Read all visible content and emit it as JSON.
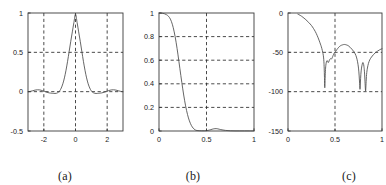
{
  "figure": {
    "background": "#ffffff",
    "axis_color": "#3a3a3a",
    "grid_color": "#2b2b2b",
    "curve_color": "#4a4a4a",
    "panel_count": 3
  },
  "panels": [
    {
      "id": "a",
      "caption": "(a)"
    },
    {
      "id": "b",
      "caption": "(b)"
    },
    {
      "id": "c",
      "caption": "(c)"
    }
  ],
  "chart_data": [
    {
      "type": "line",
      "panel": "a",
      "title": "",
      "xlabel": "",
      "ylabel": "",
      "xlim": [
        -3,
        3
      ],
      "ylim": [
        -0.5,
        1
      ],
      "xticks": [
        -2,
        0,
        2
      ],
      "xtick_labels": [
        "-2",
        "0",
        "2"
      ],
      "yticks": [
        -0.5,
        0,
        0.5,
        1
      ],
      "ytick_labels": [
        "-0.5",
        "0",
        "0.5",
        "1"
      ],
      "grid": true,
      "grid_lines_x": [
        -2,
        0,
        2
      ],
      "grid_lines_y": [
        0,
        0.5
      ],
      "legend": "none",
      "series": [
        {
          "name": "impulse-response",
          "x": [
            -3.0,
            -2.85,
            -2.7,
            -2.55,
            -2.4,
            -2.25,
            -2.1,
            -1.95,
            -1.8,
            -1.65,
            -1.5,
            -1.4,
            -1.3,
            -1.2,
            -1.1,
            -1.0,
            -0.9,
            -0.8,
            -0.7,
            -0.6,
            -0.5,
            -0.4,
            -0.3,
            -0.2,
            -0.1,
            0.0,
            0.1,
            0.2,
            0.3,
            0.4,
            0.5,
            0.6,
            0.7,
            0.8,
            0.9,
            1.0,
            1.1,
            1.2,
            1.3,
            1.4,
            1.5,
            1.65,
            1.8,
            1.95,
            2.1,
            2.25,
            2.4,
            2.55,
            2.7,
            2.85,
            3.0
          ],
          "y": [
            0.0,
            0.004,
            0.012,
            0.02,
            0.024,
            0.022,
            0.014,
            0.003,
            -0.008,
            -0.016,
            -0.02,
            -0.022,
            -0.023,
            -0.02,
            -0.01,
            0.01,
            0.046,
            0.1,
            0.175,
            0.272,
            0.386,
            0.512,
            0.64,
            0.76,
            0.88,
            0.985,
            0.88,
            0.76,
            0.64,
            0.512,
            0.386,
            0.272,
            0.175,
            0.1,
            0.046,
            0.01,
            -0.01,
            -0.02,
            -0.023,
            -0.022,
            -0.02,
            -0.016,
            -0.008,
            0.003,
            0.014,
            0.022,
            0.024,
            0.02,
            0.012,
            0.004,
            0.0
          ]
        }
      ]
    },
    {
      "type": "line",
      "panel": "b",
      "title": "",
      "xlabel": "",
      "ylabel": "",
      "xlim": [
        0,
        1
      ],
      "ylim": [
        0,
        1
      ],
      "xticks": [
        0,
        0.5,
        1
      ],
      "xtick_labels": [
        "0",
        "0.5",
        "1"
      ],
      "yticks": [
        0,
        0.2,
        0.4,
        0.6,
        0.8,
        1
      ],
      "ytick_labels": [
        "0",
        "0.2",
        "0.4",
        "0.6",
        "0.8",
        "1"
      ],
      "grid": true,
      "grid_lines_x": [
        0.5
      ],
      "grid_lines_y": [
        0.2,
        0.4,
        0.6,
        0.8
      ],
      "legend": "none",
      "series": [
        {
          "name": "magnitude-response-linear",
          "x": [
            0.0,
            0.02,
            0.04,
            0.06,
            0.08,
            0.1,
            0.12,
            0.14,
            0.16,
            0.18,
            0.2,
            0.22,
            0.24,
            0.26,
            0.28,
            0.3,
            0.32,
            0.34,
            0.36,
            0.38,
            0.4,
            0.45,
            0.5,
            0.53,
            0.56,
            0.58,
            0.6,
            0.62,
            0.65,
            0.7,
            0.75,
            0.8,
            0.85,
            0.9,
            0.95,
            1.0
          ],
          "y": [
            1.0,
            0.999,
            0.997,
            0.993,
            0.985,
            0.972,
            0.948,
            0.905,
            0.84,
            0.752,
            0.645,
            0.528,
            0.412,
            0.305,
            0.213,
            0.14,
            0.086,
            0.048,
            0.024,
            0.01,
            0.004,
            0.002,
            0.003,
            0.008,
            0.015,
            0.019,
            0.02,
            0.018,
            0.012,
            0.005,
            0.002,
            0.001,
            0.001,
            0.001,
            0.001,
            0.001
          ]
        }
      ]
    },
    {
      "type": "line",
      "panel": "c",
      "title": "",
      "xlabel": "",
      "ylabel": "",
      "xlim": [
        0,
        1
      ],
      "ylim": [
        -150,
        0
      ],
      "xticks": [
        0,
        0.5,
        1
      ],
      "xtick_labels": [
        "0",
        "0.5",
        "1"
      ],
      "yticks": [
        -150,
        -100,
        -50,
        0
      ],
      "ytick_labels": [
        "-150",
        "-100",
        "-50",
        "0"
      ],
      "grid": true,
      "grid_lines_x": [
        0.5
      ],
      "grid_lines_y": [
        -100,
        -50
      ],
      "legend": "none",
      "series": [
        {
          "name": "magnitude-response-db",
          "x": [
            0.105,
            0.13,
            0.16,
            0.19,
            0.22,
            0.25,
            0.27,
            0.29,
            0.31,
            0.33,
            0.345,
            0.355,
            0.365,
            0.372,
            0.378,
            0.382,
            0.385,
            0.388,
            0.391,
            0.394,
            0.398,
            0.402,
            0.408,
            0.415,
            0.422,
            0.428,
            0.434,
            0.44,
            0.447,
            0.455,
            0.462,
            0.47,
            0.48,
            0.492,
            0.505,
            0.52,
            0.54,
            0.56,
            0.58,
            0.6,
            0.62,
            0.64,
            0.66,
            0.68,
            0.7,
            0.715,
            0.728,
            0.74,
            0.75,
            0.757,
            0.762,
            0.766,
            0.77,
            0.775,
            0.782,
            0.79,
            0.796,
            0.802,
            0.808,
            0.813,
            0.818,
            0.822,
            0.826,
            0.83,
            0.836,
            0.845,
            0.856,
            0.87,
            0.888,
            0.908,
            0.93,
            0.952,
            0.972,
            0.988,
            1.0
          ],
          "y": [
            -1.5,
            -3.0,
            -5.5,
            -8.5,
            -12.0,
            -16.0,
            -19.5,
            -23.5,
            -28.5,
            -34.5,
            -39.5,
            -43.0,
            -47.5,
            -51.5,
            -56.0,
            -62.0,
            -70.0,
            -82.0,
            -95.0,
            -86.0,
            -74.0,
            -67.0,
            -62.5,
            -60.5,
            -61.5,
            -63.0,
            -62.0,
            -60.0,
            -58.5,
            -58.0,
            -58.5,
            -57.0,
            -54.0,
            -51.0,
            -49.0,
            -46.5,
            -43.5,
            -41.5,
            -40.5,
            -40.0,
            -40.5,
            -41.5,
            -43.5,
            -46.0,
            -49.0,
            -52.0,
            -56.0,
            -62.0,
            -70.0,
            -80.0,
            -90.0,
            -97.0,
            -89.0,
            -78.0,
            -70.0,
            -65.0,
            -63.0,
            -64.0,
            -68.0,
            -74.0,
            -84.0,
            -94.0,
            -99.0,
            -90.0,
            -78.0,
            -70.0,
            -64.0,
            -59.5,
            -56.0,
            -53.0,
            -50.5,
            -48.5,
            -47.0,
            -46.0,
            -45.5
          ]
        }
      ]
    }
  ]
}
